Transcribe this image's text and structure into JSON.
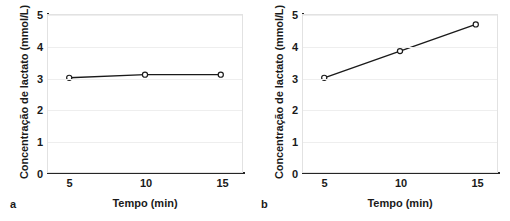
{
  "figure": {
    "panels": [
      {
        "letter": "a",
        "xlabel": "Tempo (min)",
        "ylabel": "Concentração de lactato (mmol/L)",
        "yticks": [
          "0",
          "1",
          "2",
          "3",
          "4",
          "5"
        ],
        "xticks": [
          "5",
          "10",
          "15"
        ]
      },
      {
        "letter": "b",
        "xlabel": "Tempo (min)",
        "ylabel": "Concentração de lactato (mmol/L)",
        "yticks": [
          "0",
          "1",
          "2",
          "3",
          "4",
          "5"
        ],
        "xticks": [
          "5",
          "10",
          "15"
        ]
      }
    ]
  },
  "chart_data": [
    {
      "type": "line",
      "panel": "a",
      "title": "",
      "xlabel": "Tempo (min)",
      "ylabel": "Concentração de lactato (mmol/L)",
      "x": [
        5,
        10,
        15
      ],
      "values": [
        3.0,
        3.1,
        3.1
      ],
      "xticks": [
        5,
        10,
        15
      ],
      "yticks": [
        0,
        1,
        2,
        3,
        4,
        5
      ],
      "xlim": [
        3.6,
        16.4
      ],
      "ylim": [
        0,
        5
      ],
      "grid": true,
      "grid_axis": "y",
      "legend": false,
      "marker": "open-circle",
      "line_color": "#1a1a1a",
      "grid_color": "#eeeeee"
    },
    {
      "type": "line",
      "panel": "b",
      "title": "",
      "xlabel": "Tempo (min)",
      "ylabel": "Concentração de lactato (mmol/L)",
      "x": [
        5,
        10,
        15
      ],
      "values": [
        3.0,
        3.85,
        4.7
      ],
      "xticks": [
        5,
        10,
        15
      ],
      "yticks": [
        0,
        1,
        2,
        3,
        4,
        5
      ],
      "xlim": [
        3.6,
        16.4
      ],
      "ylim": [
        0,
        5
      ],
      "grid": true,
      "grid_axis": "y",
      "legend": false,
      "marker": "open-circle",
      "line_color": "#1a1a1a",
      "grid_color": "#eeeeee"
    }
  ]
}
